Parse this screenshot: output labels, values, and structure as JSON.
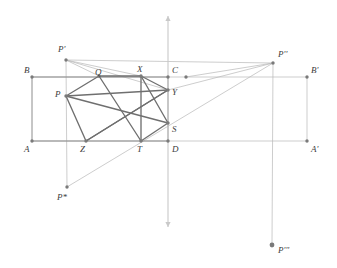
{
  "figure": {
    "width": 337,
    "height": 268,
    "background": "#ffffff",
    "colors": {
      "heavy_line": "#6f6f6f",
      "medium_line": "#8c8c8c",
      "light_line": "#b8b8b8",
      "axis_line": "#c9c9c9",
      "vertex_dot": "#7a7a7a",
      "label_text": "#3b3b3b"
    },
    "axis": {
      "name": "vertical-axis",
      "x": 168,
      "y_top": 16,
      "y_bottom": 227,
      "arrow_top": true,
      "arrow_bottom": true
    }
  },
  "points": [
    {
      "id": "A",
      "label": "A",
      "x": 32,
      "y": 141,
      "lx": 24,
      "ly": 145,
      "dot": true
    },
    {
      "id": "B",
      "label": "B",
      "x": 32,
      "y": 77,
      "lx": 24,
      "ly": 66,
      "dot": true
    },
    {
      "id": "C",
      "label": "C",
      "x": 168,
      "y": 77,
      "lx": 172,
      "ly": 66,
      "dot": true
    },
    {
      "id": "D",
      "label": "D",
      "x": 168,
      "y": 141,
      "lx": 172,
      "ly": 145,
      "dot": true
    },
    {
      "id": "Aq",
      "label": "A'",
      "x": 307,
      "y": 141,
      "lx": 311,
      "ly": 145,
      "dot": true
    },
    {
      "id": "Bq",
      "label": "B'",
      "x": 307,
      "y": 77,
      "lx": 311,
      "ly": 66,
      "dot": true
    },
    {
      "id": "P",
      "label": "P",
      "x": 66,
      "y": 96,
      "lx": 55,
      "ly": 90,
      "dot": true
    },
    {
      "id": "Q",
      "label": "Q",
      "x": 99,
      "y": 76,
      "lx": 95,
      "ly": 68,
      "dot": true
    },
    {
      "id": "X",
      "label": "X",
      "x": 141,
      "y": 76,
      "lx": 137,
      "ly": 65,
      "dot": true
    },
    {
      "id": "Y",
      "label": "Y",
      "x": 168,
      "y": 90,
      "lx": 172,
      "ly": 88,
      "dot": true
    },
    {
      "id": "S",
      "label": "S",
      "x": 168,
      "y": 123,
      "lx": 172,
      "ly": 125,
      "dot": true
    },
    {
      "id": "T",
      "label": "T",
      "x": 141,
      "y": 141,
      "lx": 137,
      "ly": 145,
      "dot": true
    },
    {
      "id": "Z",
      "label": "Z",
      "x": 86,
      "y": 141,
      "lx": 80,
      "ly": 145,
      "dot": true
    },
    {
      "id": "Pp",
      "label": "P'",
      "x": 66,
      "y": 60,
      "lx": 58,
      "ly": 45,
      "dot": true
    },
    {
      "id": "Ppp",
      "label": "P''",
      "x": 273,
      "y": 63,
      "lx": 278,
      "ly": 50,
      "dot": true
    },
    {
      "id": "Pstar",
      "label": "P*",
      "x": 67,
      "y": 187,
      "lx": 57,
      "ly": 193,
      "dot": true
    },
    {
      "id": "Pppp",
      "label": "P'''",
      "x": 272,
      "y": 245,
      "lx": 278,
      "ly": 246,
      "dot": true
    },
    {
      "id": "E",
      "label": "",
      "x": 186,
      "y": 77,
      "lx": 0,
      "ly": 0,
      "dot": true
    }
  ],
  "segments": {
    "rectangle_outer": [
      {
        "name": "segment-A-B",
        "from": "A",
        "to": "B",
        "weight": "medium"
      },
      {
        "name": "segment-B-Bq",
        "from": "B",
        "to": "Bq",
        "weight": "light"
      },
      {
        "name": "segment-A-Aq",
        "from": "A",
        "to": "Aq",
        "weight": "light"
      },
      {
        "name": "segment-Aq-Bq",
        "from": "Aq",
        "to": "Bq",
        "weight": "light"
      },
      {
        "name": "segment-B-C",
        "from": "B",
        "to": "C",
        "weight": "medium"
      },
      {
        "name": "segment-A-D",
        "from": "A",
        "to": "D",
        "weight": "medium"
      },
      {
        "name": "segment-C-D",
        "from": "C",
        "to": "D",
        "weight": "medium"
      }
    ],
    "inscribed_path": [
      {
        "name": "segment-P-Q",
        "from": "P",
        "to": "Q",
        "weight": "heavy"
      },
      {
        "name": "segment-Q-X",
        "from": "Q",
        "to": "X",
        "weight": "heavy"
      },
      {
        "name": "segment-X-Y",
        "from": "X",
        "to": "Y",
        "weight": "heavy"
      },
      {
        "name": "segment-Y-Z",
        "from": "Y",
        "to": "Z",
        "weight": "heavy"
      },
      {
        "name": "segment-Z-P",
        "from": "Z",
        "to": "P",
        "weight": "heavy"
      },
      {
        "name": "segment-P-Y",
        "from": "P",
        "to": "Y",
        "weight": "heavy"
      },
      {
        "name": "segment-P-S",
        "from": "P",
        "to": "S",
        "weight": "heavy"
      },
      {
        "name": "segment-Q-T",
        "from": "Q",
        "to": "T",
        "weight": "heavy"
      },
      {
        "name": "segment-X-T",
        "from": "X",
        "to": "T",
        "weight": "heavy"
      },
      {
        "name": "segment-S-T",
        "from": "S",
        "to": "T",
        "weight": "heavy"
      },
      {
        "name": "segment-S-X",
        "from": "S",
        "to": "X",
        "weight": "heavy"
      },
      {
        "name": "segment-Z-Y",
        "from": "Z",
        "to": "Y",
        "weight": "heavy"
      }
    ],
    "construction": [
      {
        "name": "segment-Pp-Q",
        "from": "Pp",
        "to": "Q",
        "weight": "light"
      },
      {
        "name": "segment-Pp-X",
        "from": "Pp",
        "to": "X",
        "weight": "light"
      },
      {
        "name": "segment-Pp-Y",
        "from": "Pp",
        "to": "Y",
        "weight": "light"
      },
      {
        "name": "segment-Pp-Ppp",
        "from": "Pp",
        "to": "Ppp",
        "weight": "light"
      },
      {
        "name": "segment-Ppp-E",
        "from": "Ppp",
        "to": "E",
        "weight": "light"
      },
      {
        "name": "segment-Ppp-Y",
        "from": "Ppp",
        "to": "Y",
        "weight": "light"
      },
      {
        "name": "segment-Ppp-Pstar",
        "from": "Ppp",
        "to": "Pstar",
        "weight": "light"
      },
      {
        "name": "segment-Pp-Pstar-vertical",
        "from": "Pp",
        "to": "Pstar",
        "weight": "light"
      },
      {
        "name": "segment-Ppp-Pppp-vertical",
        "from": "Ppp",
        "to": "Pppp",
        "weight": "light"
      }
    ]
  }
}
